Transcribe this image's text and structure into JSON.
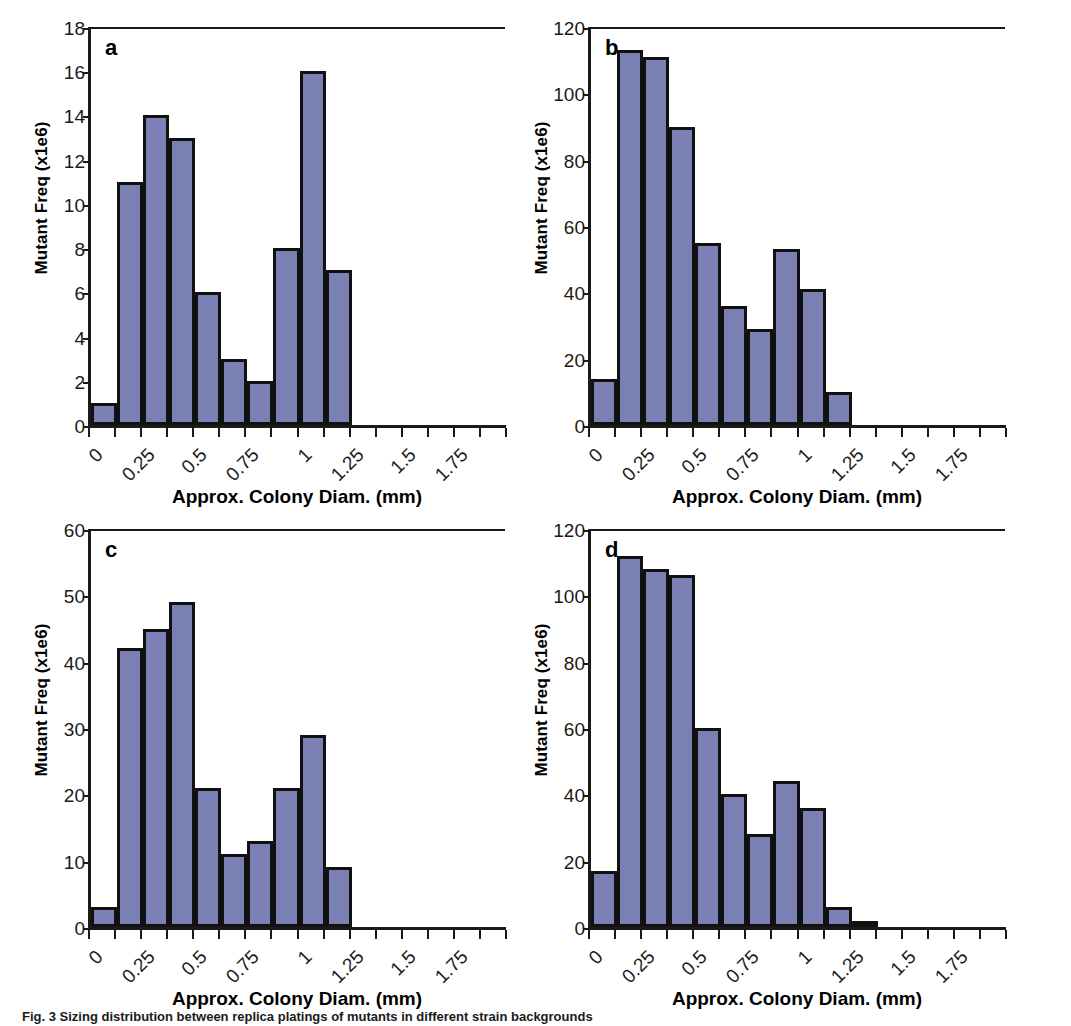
{
  "figure": {
    "caption": "Fig. 3 Sizing distribution between replica platings of mutants in different strain backgrounds"
  },
  "axis_titles": {
    "x": "Approx. Colony Diam. (mm)",
    "y": "Mutant Freq (x1e6)"
  },
  "colors": {
    "bar_fill": "#7b80b4",
    "bar_stroke": "#111111",
    "axis": "#1a1a1a"
  },
  "panels": [
    {
      "letter": "a",
      "key": "a"
    },
    {
      "letter": "b",
      "key": "b"
    },
    {
      "letter": "c",
      "key": "c"
    },
    {
      "letter": "d",
      "key": "d"
    }
  ],
  "chart_data": [
    {
      "type": "bar",
      "panel": "a",
      "title": "a",
      "xlabel": "Approx. Colony Diam. (mm)",
      "ylabel": "Mutant Freq (x1e6)",
      "bin_width": 0.125,
      "bin_starts": [
        0,
        0.125,
        0.25,
        0.375,
        0.5,
        0.625,
        0.75,
        0.875,
        1.0,
        1.125
      ],
      "values": [
        1,
        11,
        14,
        13,
        6,
        3,
        2,
        8,
        16,
        7
      ],
      "ylim": [
        0,
        18
      ],
      "yticks": [
        0,
        2,
        4,
        6,
        8,
        10,
        12,
        14,
        16,
        18
      ],
      "xlim": [
        0,
        2.0
      ],
      "xticks": [
        0,
        0.125,
        0.25,
        0.375,
        0.5,
        0.625,
        0.75,
        0.875,
        1,
        1.125,
        1.25,
        1.375,
        1.5,
        1.625,
        1.75,
        1.875,
        2
      ],
      "xtick_labels": [
        "0",
        "",
        "0.25",
        "",
        "0.5",
        "",
        "0.75",
        "",
        "1",
        "",
        "1.25",
        "",
        "1.5",
        "",
        "1.75",
        "",
        ""
      ],
      "grid": false,
      "legend": "none"
    },
    {
      "type": "bar",
      "panel": "b",
      "title": "b",
      "xlabel": "Approx. Colony Diam. (mm)",
      "ylabel": "Mutant Freq (x1e6)",
      "bin_width": 0.125,
      "bin_starts": [
        0,
        0.125,
        0.25,
        0.375,
        0.5,
        0.625,
        0.75,
        0.875,
        1.0,
        1.125
      ],
      "values": [
        14,
        113,
        111,
        90,
        55,
        36,
        29,
        53,
        41,
        10
      ],
      "ylim": [
        0,
        120
      ],
      "yticks": [
        0,
        20,
        40,
        60,
        80,
        100,
        120
      ],
      "xlim": [
        0,
        2.0
      ],
      "xticks": [
        0,
        0.125,
        0.25,
        0.375,
        0.5,
        0.625,
        0.75,
        0.875,
        1,
        1.125,
        1.25,
        1.375,
        1.5,
        1.625,
        1.75,
        1.875,
        2
      ],
      "xtick_labels": [
        "0",
        "",
        "0.25",
        "",
        "0.5",
        "",
        "0.75",
        "",
        "1",
        "",
        "1.25",
        "",
        "1.5",
        "",
        "1.75",
        "",
        ""
      ],
      "grid": false,
      "legend": "none"
    },
    {
      "type": "bar",
      "panel": "c",
      "title": "c",
      "xlabel": "Approx. Colony Diam. (mm)",
      "ylabel": "Mutant Freq (x1e6)",
      "bin_width": 0.125,
      "bin_starts": [
        0,
        0.125,
        0.25,
        0.375,
        0.5,
        0.625,
        0.75,
        0.875,
        1.0,
        1.125
      ],
      "values": [
        3,
        42,
        45,
        49,
        21,
        11,
        13,
        21,
        29,
        9
      ],
      "ylim": [
        0,
        60
      ],
      "yticks": [
        0,
        10,
        20,
        30,
        40,
        50,
        60
      ],
      "xlim": [
        0,
        2.0
      ],
      "xticks": [
        0,
        0.125,
        0.25,
        0.375,
        0.5,
        0.625,
        0.75,
        0.875,
        1,
        1.125,
        1.25,
        1.375,
        1.5,
        1.625,
        1.75,
        1.875,
        2
      ],
      "xtick_labels": [
        "0",
        "",
        "0.25",
        "",
        "0.5",
        "",
        "0.75",
        "",
        "1",
        "",
        "1.25",
        "",
        "1.5",
        "",
        "1.75",
        "",
        ""
      ],
      "grid": false,
      "legend": "none"
    },
    {
      "type": "bar",
      "panel": "d",
      "title": "d",
      "xlabel": "Approx. Colony Diam. (mm)",
      "ylabel": "Mutant Freq (x1e6)",
      "bin_width": 0.125,
      "bin_starts": [
        0,
        0.125,
        0.25,
        0.375,
        0.5,
        0.625,
        0.75,
        0.875,
        1.0,
        1.125,
        1.25
      ],
      "values": [
        17,
        112,
        108,
        106,
        60,
        40,
        28,
        44,
        36,
        6,
        1
      ],
      "ylim": [
        0,
        120
      ],
      "yticks": [
        0,
        20,
        40,
        60,
        80,
        100,
        120
      ],
      "xlim": [
        0,
        2.0
      ],
      "xticks": [
        0,
        0.125,
        0.25,
        0.375,
        0.5,
        0.625,
        0.75,
        0.875,
        1,
        1.125,
        1.25,
        1.375,
        1.5,
        1.625,
        1.75,
        1.875,
        2
      ],
      "xtick_labels": [
        "0",
        "",
        "0.25",
        "",
        "0.5",
        "",
        "0.75",
        "",
        "1",
        "",
        "1.25",
        "",
        "1.5",
        "",
        "1.75",
        "",
        ""
      ],
      "grid": false,
      "legend": "none"
    }
  ]
}
